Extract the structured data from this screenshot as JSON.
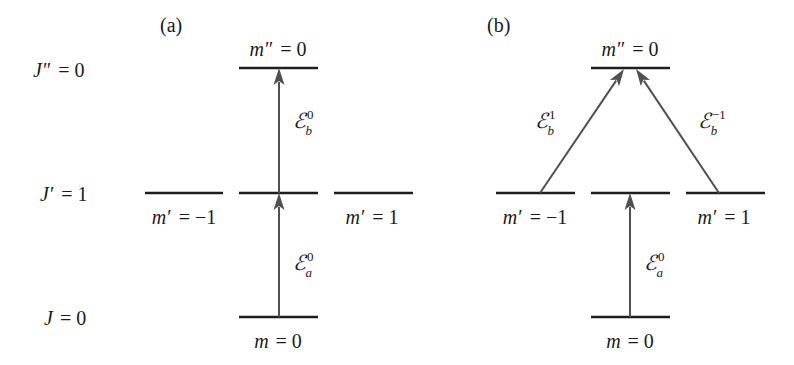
{
  "figure": {
    "panels": [
      {
        "id": "a",
        "label": "(a)",
        "label_pos": [
          160,
          32
        ]
      },
      {
        "id": "b",
        "label": "(b)",
        "label_pos": [
          487,
          32
        ]
      }
    ],
    "row_labels": [
      {
        "name": "J",
        "prime": "″",
        "eq": " = 0",
        "y": 77,
        "x": 33
      },
      {
        "name": "J",
        "prime": "′",
        "eq": " = 1",
        "y": 201,
        "x": 40
      },
      {
        "name": "J",
        "prime": "",
        "eq": " = 0",
        "y": 325,
        "x": 44
      }
    ],
    "colors": {
      "level_line": "#1e1e1e",
      "arrow": "#505050",
      "text": "#1a1a1a",
      "background": "#ffffff"
    }
  },
  "levels": {
    "a": [
      {
        "id": "a-top",
        "x1": 239,
        "x2": 318,
        "y": 68,
        "label": "m″ = 0",
        "label_var": "m",
        "label_prime": "″",
        "label_eq": " = 0",
        "label_x": 278,
        "label_y": 56
      },
      {
        "id": "a-mid-left",
        "x1": 145,
        "x2": 223,
        "y": 193,
        "label": "m′ = −1",
        "label_var": "m",
        "label_prime": "′",
        "label_eq": " = −1",
        "label_x": 184,
        "label_y": 224
      },
      {
        "id": "a-mid-center",
        "x1": 239,
        "x2": 318,
        "y": 193,
        "label": "",
        "label_var": "",
        "label_prime": "",
        "label_eq": "",
        "label_x": 278,
        "label_y": 224
      },
      {
        "id": "a-mid-right",
        "x1": 334,
        "x2": 413,
        "y": 193,
        "label": "m′ = 1",
        "label_var": "m",
        "label_prime": "′",
        "label_eq": " = 1",
        "label_x": 372,
        "label_y": 224
      },
      {
        "id": "a-bottom",
        "x1": 239,
        "x2": 318,
        "y": 317,
        "label": "m = 0",
        "label_var": "m",
        "label_prime": "",
        "label_eq": " = 0",
        "label_x": 278,
        "label_y": 348
      }
    ],
    "b": [
      {
        "id": "b-top",
        "x1": 591,
        "x2": 670,
        "y": 68,
        "label": "m″ = 0",
        "label_var": "m",
        "label_prime": "″",
        "label_eq": " = 0",
        "label_x": 630,
        "label_y": 56
      },
      {
        "id": "b-mid-left",
        "x1": 496,
        "x2": 575,
        "y": 193,
        "label": "m′ = −1",
        "label_var": "m",
        "label_prime": "′",
        "label_eq": " = −1",
        "label_x": 535,
        "label_y": 224
      },
      {
        "id": "b-mid-center",
        "x1": 591,
        "x2": 670,
        "y": 193,
        "label": "",
        "label_var": "",
        "label_prime": "",
        "label_eq": "",
        "label_x": 630,
        "label_y": 224
      },
      {
        "id": "b-mid-right",
        "x1": 686,
        "x2": 765,
        "y": 193,
        "label": "m′ = 1",
        "label_var": "m",
        "label_prime": "′",
        "label_eq": " = 1",
        "label_x": 724,
        "label_y": 224
      },
      {
        "id": "b-bottom",
        "x1": 591,
        "x2": 670,
        "y": 317,
        "label": "m = 0",
        "label_var": "m",
        "label_prime": "",
        "label_eq": " = 0",
        "label_x": 630,
        "label_y": 348
      }
    ]
  },
  "transitions": [
    {
      "id": "a-Ea0",
      "panel": "a",
      "x1": 279,
      "y1": 317,
      "x2": 279,
      "y2": 193,
      "field": "ℰ",
      "sub": "a",
      "sup": "0",
      "label": "ℰ_a^0",
      "label_x": 293,
      "label_y": 270
    },
    {
      "id": "a-Eb0",
      "panel": "a",
      "x1": 279,
      "y1": 193,
      "x2": 279,
      "y2": 68,
      "field": "ℰ",
      "sub": "b",
      "sup": "0",
      "label": "ℰ_b^0",
      "label_x": 293,
      "label_y": 128
    },
    {
      "id": "b-Ea0",
      "panel": "b",
      "x1": 630,
      "y1": 317,
      "x2": 630,
      "y2": 193,
      "field": "ℰ",
      "sub": "a",
      "sup": "0",
      "label": "ℰ_a^0",
      "label_x": 644,
      "label_y": 270
    },
    {
      "id": "b-Eb1",
      "panel": "b",
      "x1": 540,
      "y1": 193,
      "x2": 624,
      "y2": 69,
      "field": "ℰ",
      "sub": "b",
      "sup": "1",
      "label": "ℰ_b^1",
      "label_x": 535,
      "label_y": 128
    },
    {
      "id": "b-Eb-1",
      "panel": "b",
      "x1": 719,
      "y1": 193,
      "x2": 636,
      "y2": 69,
      "field": "ℰ",
      "sub": "b",
      "sup": "−1",
      "label": "ℰ_b^−1",
      "label_x": 698,
      "label_y": 128
    }
  ]
}
